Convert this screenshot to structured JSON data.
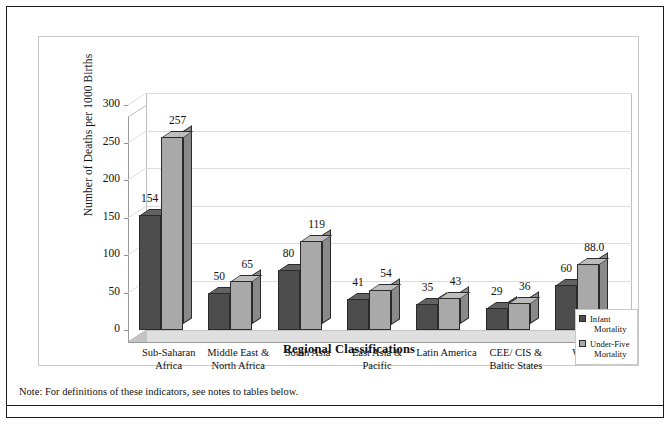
{
  "chart_data": {
    "type": "bar",
    "title": "",
    "xlabel": "Regional Classifications",
    "ylabel": "Number of Deaths per 1000 Births",
    "categories": [
      "Sub-Saharan Africa",
      "Middle East & North Africa",
      "South Asia",
      "East Asia & Pacific",
      "Latin America",
      "CEE/ CIS & Baltic States",
      "World"
    ],
    "category_lines": [
      [
        "Sub-Saharan",
        "Africa"
      ],
      [
        "Middle East &",
        "North Africa"
      ],
      [
        "South Asia"
      ],
      [
        "East Asia &",
        "Pacific"
      ],
      [
        "Latin America"
      ],
      [
        "CEE/ CIS &",
        "Baltic States"
      ],
      [
        "World"
      ]
    ],
    "series": [
      {
        "name": "Infant Mortality",
        "color": "#4d4d4d",
        "values": [
          154,
          50,
          80,
          41,
          35,
          29,
          60
        ],
        "labels": [
          "154",
          "50",
          "80",
          "41",
          "35",
          "29",
          "60"
        ]
      },
      {
        "name": "Under-Five Mortality",
        "color": "#a9a9a9",
        "values": [
          257,
          65,
          119,
          54,
          43,
          36,
          88.0
        ],
        "labels": [
          "257",
          "65",
          "119",
          "54",
          "43",
          "36",
          "88.0"
        ]
      }
    ],
    "ylim": [
      0,
      300
    ],
    "yticks": [
      0,
      50,
      100,
      150,
      200,
      250,
      300
    ],
    "ytick_labels": [
      "0",
      "50",
      "100",
      "150",
      "200",
      "250",
      "300"
    ],
    "grid": true,
    "legend_position": "bottom-right",
    "style": "3d-clustered-column"
  },
  "legend": {
    "items": [
      {
        "label_lines": [
          "Infant",
          "Mortality"
        ],
        "swatch": "s0"
      },
      {
        "label_lines": [
          "Under-Five",
          "Mortality"
        ],
        "swatch": "s1"
      }
    ]
  },
  "footnote": {
    "text": "Note: For definitions of these indicators, see notes to tables below."
  }
}
